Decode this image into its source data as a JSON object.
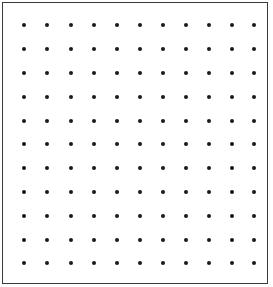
{
  "grid": {
    "columns": 11,
    "rows": 11,
    "x_positions": [
      24,
      47,
      70.5,
      94,
      117,
      139.5,
      162.5,
      185.5,
      209,
      232,
      254
    ],
    "y_positions": [
      25,
      49,
      72.5,
      96.5,
      120.5,
      144,
      168,
      192,
      215.5,
      239.5,
      263
    ],
    "dot_color": "#1a1a1a",
    "border_color": "#3a3a3a"
  }
}
